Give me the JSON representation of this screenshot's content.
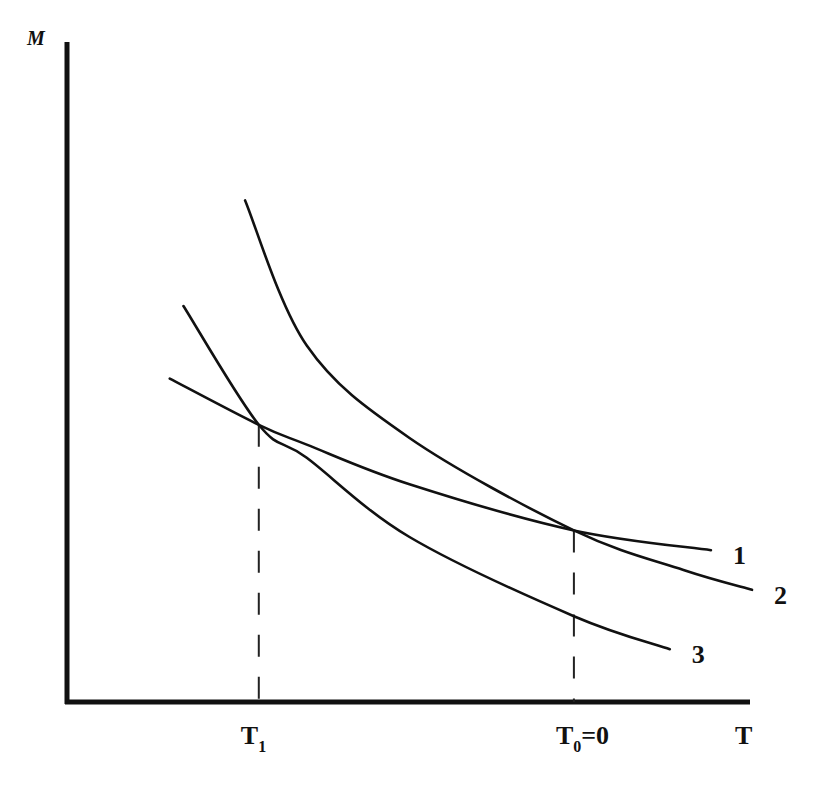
{
  "chart_data": {
    "type": "line",
    "title": "",
    "xlabel": "T",
    "ylabel": "M",
    "grid": false,
    "xlim": [
      0,
      10
    ],
    "ylim": [
      0,
      10
    ],
    "x_ticks": [
      {
        "label": "T",
        "sub": "1",
        "rest": "",
        "x": 2.8
      },
      {
        "label": "T",
        "sub": "0",
        "rest": "=0",
        "x": 7.4
      }
    ],
    "series": [
      {
        "name": "1",
        "label": "1",
        "points": [
          [
            1.5,
            4.9
          ],
          [
            2.8,
            4.2
          ],
          [
            3.5,
            3.9
          ],
          [
            5.0,
            3.3
          ],
          [
            7.4,
            2.6
          ],
          [
            9.4,
            2.3
          ]
        ]
      },
      {
        "name": "2",
        "label": "2",
        "points": [
          [
            2.6,
            7.6
          ],
          [
            3.5,
            5.4
          ],
          [
            5.0,
            4.0
          ],
          [
            7.4,
            2.6
          ],
          [
            9.0,
            2.0
          ],
          [
            10.0,
            1.7
          ]
        ]
      },
      {
        "name": "3",
        "label": "3",
        "points": [
          [
            1.7,
            6.0
          ],
          [
            2.8,
            4.2
          ],
          [
            3.5,
            3.7
          ],
          [
            5.0,
            2.5
          ],
          [
            7.4,
            1.3
          ],
          [
            8.8,
            0.8
          ]
        ]
      }
    ],
    "dashed_guides": [
      {
        "x": 2.8,
        "y": 4.2
      },
      {
        "x": 7.4,
        "y": 2.6
      }
    ]
  }
}
